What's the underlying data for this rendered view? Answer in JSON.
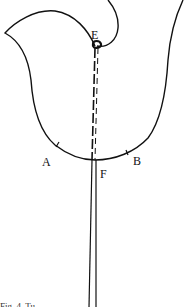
{
  "diagram": {
    "type": "pattern-piece",
    "labels": {
      "A": "A",
      "B": "B",
      "E": "E",
      "F": "F"
    },
    "caption": "Fig. 4. Tu...",
    "colors": {
      "stroke": "#111111",
      "background": "#ffffff"
    }
  }
}
